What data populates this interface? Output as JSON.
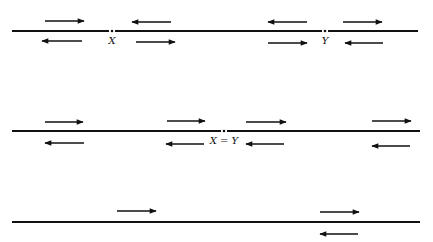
{
  "diagram": {
    "lines": [
      {
        "id": "line-1",
        "y": 31,
        "x1": 12,
        "x2": 418,
        "points": [
          {
            "label": "X",
            "x": 112
          },
          {
            "label": "Y",
            "x": 325
          }
        ],
        "arrows": [
          {
            "dir": "right",
            "x1": 45,
            "x2": 84,
            "y": 21
          },
          {
            "dir": "left",
            "x1": 132,
            "x2": 171,
            "y": 22
          },
          {
            "dir": "left",
            "x1": 42,
            "x2": 82,
            "y": 41
          },
          {
            "dir": "right",
            "x1": 136,
            "x2": 175,
            "y": 42
          },
          {
            "dir": "left",
            "x1": 268,
            "x2": 307,
            "y": 22
          },
          {
            "dir": "right",
            "x1": 343,
            "x2": 382,
            "y": 22
          },
          {
            "dir": "right",
            "x1": 268,
            "x2": 307,
            "y": 43
          },
          {
            "dir": "left",
            "x1": 345,
            "x2": 383,
            "y": 43
          }
        ]
      },
      {
        "id": "line-2",
        "y": 131,
        "x1": 12,
        "x2": 420,
        "points": [
          {
            "label": "X = Y",
            "x": 224
          }
        ],
        "arrows": [
          {
            "dir": "right",
            "x1": 45,
            "x2": 83,
            "y": 122
          },
          {
            "dir": "left",
            "x1": 45,
            "x2": 84,
            "y": 143
          },
          {
            "dir": "right",
            "x1": 167,
            "x2": 205,
            "y": 121
          },
          {
            "dir": "left",
            "x1": 166,
            "x2": 204,
            "y": 144
          },
          {
            "dir": "right",
            "x1": 246,
            "x2": 286,
            "y": 122
          },
          {
            "dir": "left",
            "x1": 246,
            "x2": 284,
            "y": 144
          },
          {
            "dir": "right",
            "x1": 372,
            "x2": 411,
            "y": 121
          },
          {
            "dir": "left",
            "x1": 372,
            "x2": 410,
            "y": 146
          }
        ]
      },
      {
        "id": "line-3",
        "y": 222,
        "x1": 12,
        "x2": 420,
        "points": [],
        "arrows": [
          {
            "dir": "right",
            "x1": 117,
            "x2": 156,
            "y": 211
          },
          {
            "dir": "right",
            "x1": 320,
            "x2": 359,
            "y": 212
          },
          {
            "dir": "left",
            "x1": 320,
            "x2": 358,
            "y": 234
          }
        ]
      }
    ],
    "colors": {
      "ink": "#111111",
      "background": "#ffffff"
    }
  }
}
